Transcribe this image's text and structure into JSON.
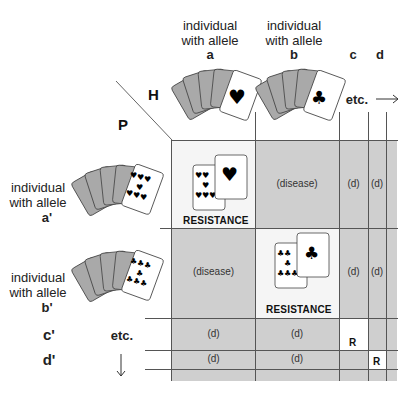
{
  "axes": {
    "host_label": "H",
    "pathogen_label": "P"
  },
  "columns": [
    {
      "caption": "individual\nwith allele",
      "allele": "a",
      "card_suit": "heart"
    },
    {
      "caption": "individual\nwith allele",
      "allele": "b",
      "card_suit": "club"
    },
    {
      "allele": "c"
    },
    {
      "allele": "d"
    }
  ],
  "column_etc": "etc.",
  "column_arrow": "→",
  "rows": [
    {
      "caption": "individual\nwith allele",
      "allele": "a'",
      "card_suit": "heart"
    },
    {
      "caption": "individual\nwith allele",
      "allele": "b'",
      "card_suit": "club"
    },
    {
      "allele": "c'"
    },
    {
      "allele": "d'"
    }
  ],
  "row_etc": "etc.",
  "row_arrow": "↓",
  "cells": {
    "aa": "RESISTANCE",
    "ab": "(disease)",
    "ac": "(d)",
    "ad": "(d)",
    "ba": "(disease)",
    "bb": "RESISTANCE",
    "bc": "(d)",
    "bd": "(d)",
    "ca": "(d)",
    "cb": "(d)",
    "cc": "R",
    "da": "(d)",
    "db": "(d)",
    "dd": "R"
  },
  "colors": {
    "disease_cell": "#cfcfcf",
    "resistance_cell": "#f5f5f5",
    "grid_line": "#555555"
  }
}
